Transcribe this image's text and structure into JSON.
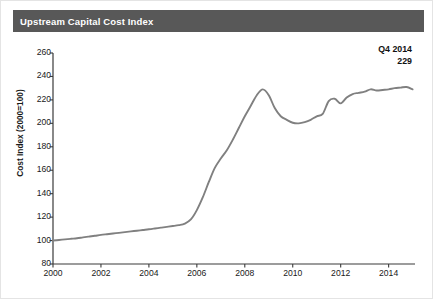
{
  "header": {
    "title": "Upstream Capital Cost Index"
  },
  "annotation": {
    "line1": "Q4 2014",
    "line2": "229"
  },
  "chart_data": {
    "type": "line",
    "title": "Upstream Capital Cost Index",
    "xlabel": "",
    "ylabel": "Cost Index (2000=100)",
    "xlim": [
      2000,
      2015.1
    ],
    "ylim": [
      80,
      260
    ],
    "ytick_labels": [
      "260",
      "240",
      "220",
      "200",
      "180",
      "160",
      "140",
      "120",
      "100",
      "80"
    ],
    "ytick_values": [
      260,
      240,
      220,
      200,
      180,
      160,
      140,
      120,
      100,
      80
    ],
    "xtick_labels": [
      "2000",
      "2002",
      "2004",
      "2006",
      "2008",
      "2010",
      "2012",
      "2014"
    ],
    "xtick_values": [
      2000,
      2002,
      2004,
      2006,
      2008,
      2010,
      2012,
      2014
    ],
    "grid": false,
    "legend": "none",
    "line_color": "#808080",
    "series": [
      {
        "name": "Upstream Capital Cost Index",
        "x": [
          2000.0,
          2000.25,
          2000.5,
          2000.75,
          2001.0,
          2001.25,
          2001.5,
          2001.75,
          2002.0,
          2002.25,
          2002.5,
          2002.75,
          2003.0,
          2003.25,
          2003.5,
          2003.75,
          2004.0,
          2004.25,
          2004.5,
          2004.75,
          2005.0,
          2005.25,
          2005.5,
          2005.75,
          2006.0,
          2006.25,
          2006.5,
          2006.75,
          2007.0,
          2007.25,
          2007.5,
          2007.75,
          2008.0,
          2008.25,
          2008.5,
          2008.75,
          2009.0,
          2009.25,
          2009.5,
          2009.75,
          2010.0,
          2010.25,
          2010.5,
          2010.75,
          2011.0,
          2011.25,
          2011.5,
          2011.75,
          2012.0,
          2012.25,
          2012.5,
          2012.75,
          2013.0,
          2013.25,
          2013.5,
          2013.75,
          2014.0,
          2014.25,
          2014.5,
          2014.75,
          2015.0
        ],
        "values": [
          100,
          100.5,
          101,
          101.5,
          102,
          102.7,
          103.4,
          104.1,
          104.8,
          105.4,
          106,
          106.6,
          107.2,
          107.8,
          108.4,
          109,
          109.6,
          110.3,
          111,
          111.7,
          112.4,
          113.2,
          114.5,
          118,
          126,
          137,
          150,
          162,
          170,
          177,
          186,
          196,
          206,
          215,
          224,
          229,
          224,
          213,
          206,
          203,
          200.5,
          200,
          201,
          203,
          206,
          208,
          219,
          221,
          217,
          222,
          225,
          226,
          227,
          229,
          228,
          228.5,
          229,
          230,
          230.5,
          231,
          229
        ]
      }
    ],
    "annotations": [
      {
        "label": "Q4 2014",
        "value": 229,
        "x": 2014.75
      }
    ]
  }
}
